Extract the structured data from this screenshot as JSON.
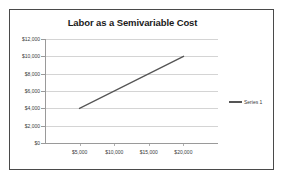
{
  "chart_data": {
    "type": "line",
    "title": "Labor as a Semivariable Cost",
    "xlabel": "",
    "ylabel": "",
    "xlim": [
      0,
      25000
    ],
    "ylim": [
      0,
      12000
    ],
    "grid": "horizontal",
    "legend_position": "right",
    "x_ticks": [
      {
        "value": 5000,
        "label": "$5,000"
      },
      {
        "value": 10000,
        "label": "$10,000"
      },
      {
        "value": 15000,
        "label": "$15,000"
      },
      {
        "value": 20000,
        "label": "$20,000"
      }
    ],
    "y_ticks": [
      {
        "value": 12000,
        "label": "$12,000"
      },
      {
        "value": 10000,
        "label": "$10,000"
      },
      {
        "value": 8000,
        "label": "$8,000"
      },
      {
        "value": 6000,
        "label": "$6,000"
      },
      {
        "value": 4000,
        "label": "$4,000"
      },
      {
        "value": 2000,
        "label": "$2,000"
      },
      {
        "value": 0,
        "label": "$0"
      }
    ],
    "series": [
      {
        "name": "Series 1",
        "color": "#555555",
        "x": [
          5000,
          20000
        ],
        "values": [
          4000,
          10000
        ]
      }
    ]
  },
  "legend": {
    "entries": [
      {
        "label": "Series 1",
        "marker": "line-marker"
      }
    ]
  },
  "colors": {
    "series_line": "#555555",
    "gridline": "#d4d4d4",
    "axis": "#9a9a9a",
    "border": "#4a4a4a",
    "text": "#3a3a3a",
    "title_text": "#1a1a1a",
    "background": "#ffffff"
  }
}
